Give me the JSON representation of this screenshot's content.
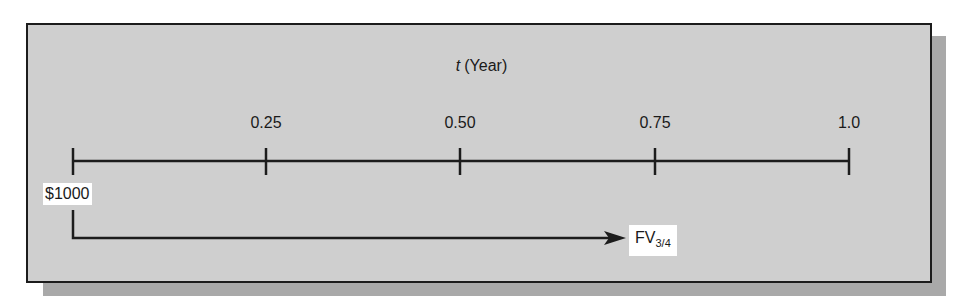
{
  "diagram": {
    "axis_title_var": "t",
    "axis_title_unit": "(Year)",
    "ticks": [
      {
        "label": "0.25",
        "x": 266
      },
      {
        "label": "0.50",
        "x": 460
      },
      {
        "label": "0.75",
        "x": 655
      },
      {
        "label": "1.0",
        "x": 849
      }
    ],
    "start_value": "$1000",
    "end_label_main": "FV",
    "end_label_sub": "3/4",
    "colors": {
      "panel": "#cfcfcf",
      "shadow": "#a9a9a9",
      "line": "#1c1c1c"
    }
  }
}
